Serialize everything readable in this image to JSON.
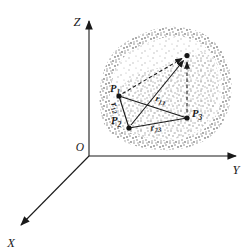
{
  "figure": {
    "axes": {
      "z_label": "Z",
      "y_label": "Y",
      "x_label": "X",
      "origin_label": "O"
    },
    "points": [
      {
        "name": "P",
        "sub": "1"
      },
      {
        "name": "P",
        "sub": "2"
      },
      {
        "name": "P",
        "sub": "3"
      }
    ],
    "distances": [
      {
        "name": "r",
        "sub": "12"
      },
      {
        "name": "r",
        "sub": "13"
      },
      {
        "name": "r",
        "sub": "23"
      }
    ],
    "colors": {
      "ink": "#1a1a1a",
      "stipple_light": "#b4b4b4",
      "stipple_medium": "#979797",
      "stipple_dark": "#868686",
      "background": "#ffffff"
    }
  }
}
